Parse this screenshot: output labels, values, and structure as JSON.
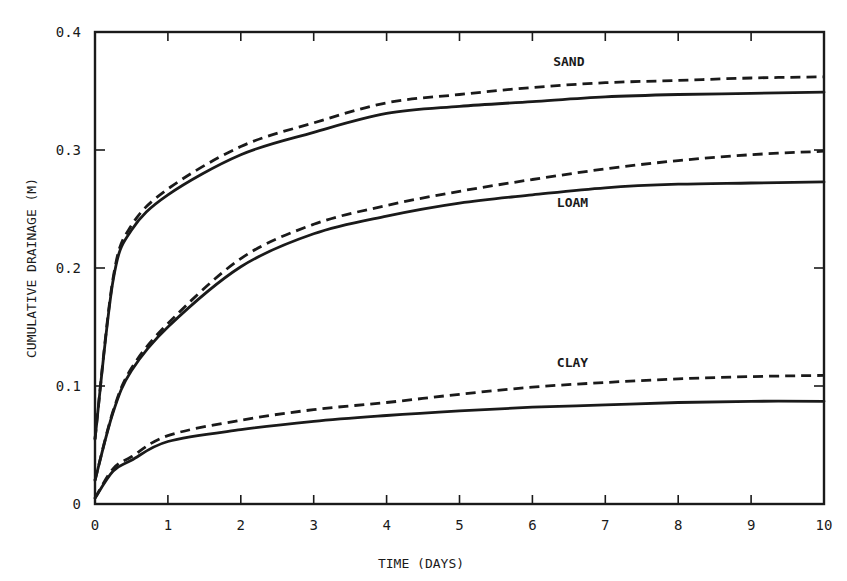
{
  "chart_data": {
    "type": "line",
    "title": "",
    "xlabel": "TIME (DAYS)",
    "ylabel": "CUMULATIVE DRAINAGE (M)",
    "xlim": [
      0,
      10
    ],
    "ylim": [
      0,
      0.4
    ],
    "grid": false,
    "legend": "inline labels near curves",
    "x_ticks": [
      0,
      1,
      2,
      3,
      4,
      5,
      6,
      7,
      8,
      9,
      10
    ],
    "x_tick_labels": [
      "0",
      "1",
      "2",
      "3",
      "4",
      "5",
      "6",
      "7",
      "8",
      "9",
      "10"
    ],
    "y_ticks": [
      0,
      0.1,
      0.2,
      0.3,
      0.4
    ],
    "y_tick_labels": [
      "0",
      "0.1",
      "0.2",
      "0.3",
      "0.4"
    ],
    "x": [
      0,
      0.25,
      0.5,
      1,
      2,
      3,
      4,
      5,
      6,
      7,
      8,
      9,
      10
    ],
    "series": [
      {
        "name": "SAND (solid)",
        "soil": "SAND",
        "style": "solid",
        "values": [
          0.055,
          0.19,
          0.232,
          0.262,
          0.296,
          0.315,
          0.331,
          0.337,
          0.341,
          0.345,
          0.347,
          0.348,
          0.349
        ]
      },
      {
        "name": "SAND (dashed)",
        "soil": "SAND",
        "style": "dashed",
        "values": [
          0.055,
          0.192,
          0.236,
          0.267,
          0.303,
          0.323,
          0.34,
          0.347,
          0.353,
          0.357,
          0.359,
          0.361,
          0.362
        ]
      },
      {
        "name": "LOAM (solid)",
        "soil": "LOAM",
        "style": "solid",
        "values": [
          0.02,
          0.078,
          0.113,
          0.15,
          0.201,
          0.229,
          0.244,
          0.255,
          0.262,
          0.268,
          0.271,
          0.272,
          0.273
        ]
      },
      {
        "name": "LOAM (dashed)",
        "soil": "LOAM",
        "style": "dashed",
        "values": [
          0.02,
          0.079,
          0.115,
          0.153,
          0.208,
          0.237,
          0.253,
          0.265,
          0.275,
          0.284,
          0.291,
          0.296,
          0.299
        ]
      },
      {
        "name": "CLAY (solid)",
        "soil": "CLAY",
        "style": "solid",
        "values": [
          0.005,
          0.028,
          0.037,
          0.053,
          0.063,
          0.07,
          0.075,
          0.079,
          0.082,
          0.084,
          0.086,
          0.087,
          0.087
        ]
      },
      {
        "name": "CLAY (dashed)",
        "soil": "CLAY",
        "style": "dashed",
        "values": [
          0.005,
          0.03,
          0.04,
          0.058,
          0.071,
          0.08,
          0.086,
          0.093,
          0.099,
          0.103,
          0.106,
          0.108,
          0.109
        ]
      }
    ],
    "annotations": [
      {
        "text": "SAND",
        "x": 6.5,
        "y": 0.371
      },
      {
        "text": "LOAM",
        "x": 6.55,
        "y": 0.252
      },
      {
        "text": "CLAY",
        "x": 6.55,
        "y": 0.116
      }
    ]
  },
  "colors": {
    "ink": "#1a1a1a",
    "background": "#ffffff"
  }
}
